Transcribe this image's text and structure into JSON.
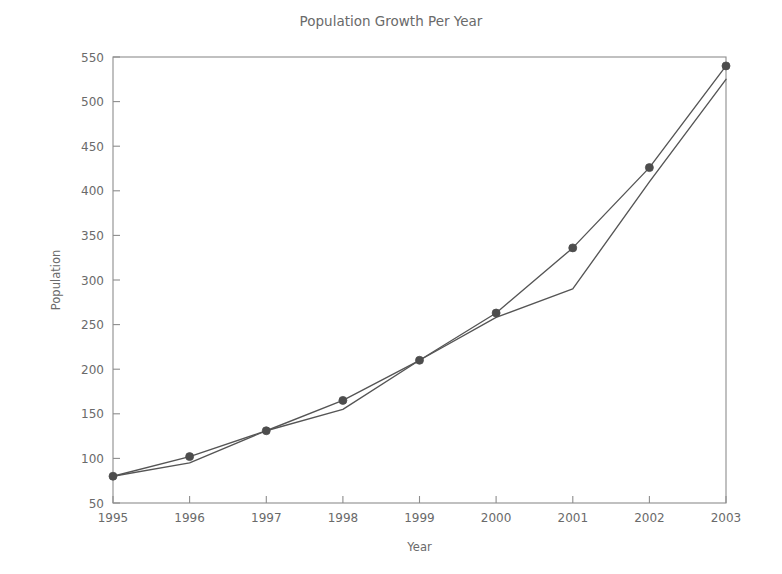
{
  "chart_data": {
    "type": "line",
    "title": "Population Growth Per Year",
    "xlabel": "Year",
    "ylabel": "Population",
    "categories": [
      "1995",
      "1996",
      "1997",
      "1998",
      "1999",
      "2000",
      "2001",
      "2002",
      "2003"
    ],
    "x": [
      1995,
      1996,
      1997,
      1998,
      1999,
      2000,
      2001,
      2002,
      2003
    ],
    "xlim": [
      1995,
      2003
    ],
    "ylim": [
      50,
      550
    ],
    "xticks": [
      "1995",
      "1996",
      "1997",
      "1998",
      "1999",
      "2000",
      "2001",
      "2002",
      "2003"
    ],
    "yticks": [
      "50",
      "100",
      "150",
      "200",
      "250",
      "300",
      "350",
      "400",
      "450",
      "500",
      "550"
    ],
    "grid": false,
    "legend": "none",
    "series": [
      {
        "name": "Series A",
        "marker": "circle",
        "color": "#4d4d4d",
        "values": [
          80,
          102,
          131,
          165,
          210,
          263,
          336,
          426,
          540
        ]
      },
      {
        "name": "Series B",
        "marker": "none",
        "color": "#555555",
        "values": [
          80,
          95,
          131,
          155,
          210,
          258,
          290,
          410,
          525
        ]
      }
    ]
  },
  "figure": {
    "title": "Population Growth Per Year",
    "x_axis_title": "Year",
    "y_axis_title": "Population"
  }
}
